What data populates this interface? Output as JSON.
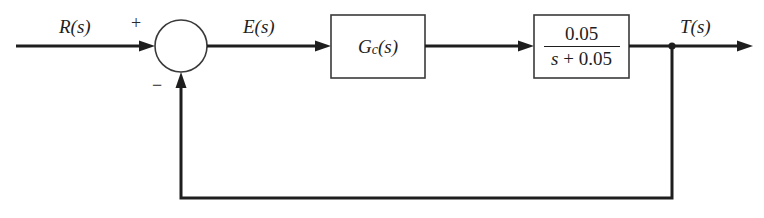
{
  "diagram": {
    "type": "feedback-control-block-diagram",
    "signals": {
      "input": {
        "name": "R",
        "arg": "(s)"
      },
      "error": {
        "name": "E",
        "arg": "(s)"
      },
      "output": {
        "name": "T",
        "arg": "(s)"
      }
    },
    "summing_junction": {
      "plus_sign": "+",
      "minus_sign": "−"
    },
    "blocks": [
      {
        "id": "controller",
        "name": "G",
        "subscript": "c",
        "arg": "(s)"
      },
      {
        "id": "plant",
        "numerator": "0.05",
        "denominator_var": "s",
        "denominator_rest": " + 0.05"
      }
    ],
    "feedback": "unity negative feedback",
    "colors": {
      "line": "#1e1e1e",
      "box_border": "#3a3a3a",
      "background": "#ffffff"
    }
  }
}
